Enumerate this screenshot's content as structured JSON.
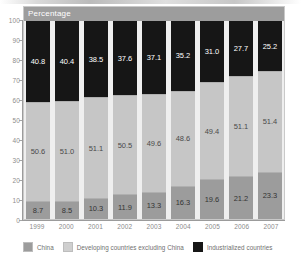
{
  "plot_header": "Percentage",
  "chart_data": {
    "type": "bar",
    "title": "Percentage",
    "xlabel": "",
    "ylabel": "Percentage",
    "ylim": [
      0,
      100
    ],
    "yticks": [
      0,
      10,
      20,
      30,
      40,
      50,
      60,
      70,
      80,
      90,
      100
    ],
    "grid": false,
    "stacked": true,
    "legend_position": "bottom",
    "categories": [
      "1999",
      "2000",
      "2001",
      "2002",
      "2003",
      "2004",
      "2005",
      "2006",
      "2007"
    ],
    "series": [
      {
        "name": "China",
        "color": "#9c9c9c",
        "values": [
          8.7,
          8.5,
          10.3,
          11.9,
          13.3,
          16.3,
          19.6,
          21.2,
          23.3
        ]
      },
      {
        "name": "Developing countries excluding China",
        "color": "#c6c6c6",
        "values": [
          50.6,
          51.0,
          51.1,
          50.5,
          49.6,
          48.6,
          49.4,
          51.1,
          51.4
        ]
      },
      {
        "name": "Industrialized countries",
        "color": "#161616",
        "values": [
          40.8,
          40.4,
          38.5,
          37.6,
          37.1,
          35.2,
          31.0,
          27.7,
          25.2
        ]
      }
    ]
  }
}
